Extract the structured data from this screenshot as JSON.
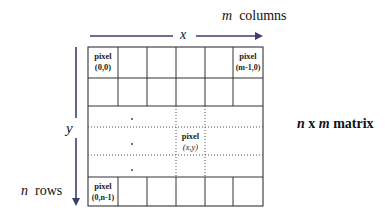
{
  "diagram": {
    "title": "n x m matrix",
    "title_parts": {
      "n": "n",
      "x": "x",
      "m": "m",
      "word": "matrix"
    },
    "columns_label": {
      "var": "m",
      "text": "columns"
    },
    "rows_label": {
      "var": "n",
      "text": "rows"
    },
    "x_axis_label": "x",
    "y_axis_label": "y",
    "arrow_color": "#3a3f6e",
    "grid": {
      "columns": 6,
      "rows": 6,
      "dotted_rows": [
        2,
        3,
        4
      ],
      "dotted_columns": [
        3,
        4
      ]
    },
    "pixels": {
      "top_left": {
        "word": "pixel",
        "coord": "(0,0)"
      },
      "top_right": {
        "word": "pixel",
        "coord": "(m-1,0)"
      },
      "center": {
        "word": "pixel",
        "coord": "(x,y)"
      },
      "bottom_left": {
        "word": "pixel",
        "coord": "(0,n-1)"
      }
    }
  }
}
